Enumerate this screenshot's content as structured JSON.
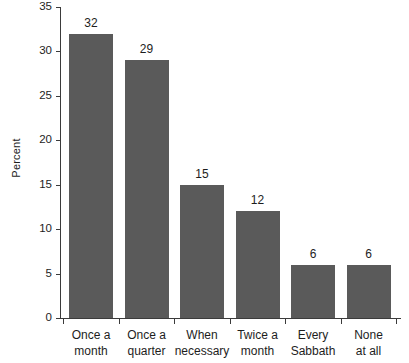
{
  "chart_data": {
    "type": "bar",
    "title": "",
    "xlabel": "",
    "ylabel": "Percent",
    "categories": [
      "Once a month",
      "Once a quarter",
      "When necessary",
      "Twice a month",
      "Every Sabbath",
      "None at all"
    ],
    "category_lines": [
      [
        "Once a",
        "month"
      ],
      [
        "Once a",
        "quarter"
      ],
      [
        "When",
        "necessary"
      ],
      [
        "Twice a",
        "month"
      ],
      [
        "Every",
        "Sabbath"
      ],
      [
        "None",
        "at all"
      ]
    ],
    "values": [
      32,
      29,
      15,
      12,
      6,
      6
    ],
    "value_labels": [
      "32",
      "29",
      "15",
      "12",
      "6",
      "6"
    ],
    "ylim": [
      0,
      35
    ],
    "yticks": [
      0,
      5,
      10,
      15,
      20,
      25,
      30,
      35
    ],
    "ytick_labels": [
      "0",
      "5",
      "10",
      "15",
      "20",
      "25",
      "30",
      "35"
    ],
    "grid": false,
    "legend": false,
    "bar_color": "#5a5a5a",
    "axis_color": "#3b3b3b",
    "text_color": "#1d1d1d",
    "background": "#ffffff"
  }
}
